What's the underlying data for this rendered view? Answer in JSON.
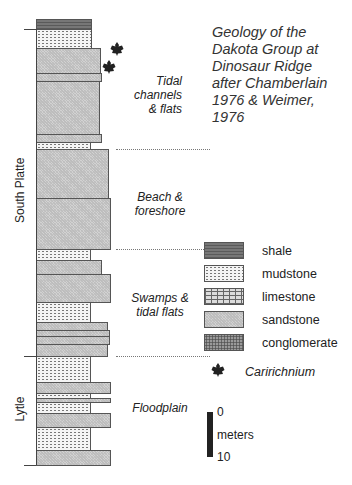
{
  "title": "Geology of the Dakota Group at Dinosaur Ridge after Chamberlain 1976 & Weimer, 1976",
  "title_lines": [
    "Geology of the",
    "Dakota Group at",
    "Dinosaur Ridge",
    "after Chamberlain",
    "1976 & Weimer,",
    "1976"
  ],
  "formations": [
    {
      "name": "South Platte",
      "label": "South Platte"
    },
    {
      "name": "Lytle",
      "label": "Lytle"
    }
  ],
  "environments": [
    {
      "label_lines": [
        "Tidal",
        "channels",
        "& flats"
      ]
    },
    {
      "label_lines": [
        "Beach &",
        "foreshore"
      ]
    },
    {
      "label_lines": [
        "Swamps &",
        "tidal flats"
      ]
    },
    {
      "label_lines": [
        "Floodplain"
      ]
    }
  ],
  "column": {
    "left": 36,
    "layers": [
      {
        "lith": "shale",
        "top": 19,
        "bottom": 29,
        "right": 92
      },
      {
        "lith": "mudstone",
        "top": 29,
        "bottom": 48,
        "right": 92
      },
      {
        "lith": "sandstone",
        "top": 48,
        "bottom": 73,
        "right": 101
      },
      {
        "lith": "sandstone",
        "top": 73,
        "bottom": 81,
        "right": 102
      },
      {
        "lith": "sandstone",
        "top": 81,
        "bottom": 134,
        "right": 100
      },
      {
        "lith": "sandstone",
        "top": 134,
        "bottom": 142,
        "right": 102
      },
      {
        "lith": "mudstone",
        "top": 142,
        "bottom": 149,
        "right": 91
      },
      {
        "lith": "sandstone",
        "top": 149,
        "bottom": 198,
        "right": 109
      },
      {
        "lith": "sandstone",
        "top": 198,
        "bottom": 249,
        "right": 111
      },
      {
        "lith": "mudstone",
        "top": 249,
        "bottom": 260,
        "right": 91
      },
      {
        "lith": "sandstone",
        "top": 260,
        "bottom": 274,
        "right": 102
      },
      {
        "lith": "sandstone",
        "top": 274,
        "bottom": 302,
        "right": 111
      },
      {
        "lith": "mudstone",
        "top": 302,
        "bottom": 322,
        "right": 91
      },
      {
        "lith": "sandstone",
        "top": 322,
        "bottom": 330,
        "right": 108
      },
      {
        "lith": "sandstone",
        "top": 330,
        "bottom": 336,
        "right": 110
      },
      {
        "lith": "sandstone",
        "top": 336,
        "bottom": 344,
        "right": 110
      },
      {
        "lith": "sandstone",
        "top": 344,
        "bottom": 356,
        "right": 108
      },
      {
        "lith": "mudstone",
        "top": 356,
        "bottom": 382,
        "right": 91
      },
      {
        "lith": "sandstone",
        "top": 382,
        "bottom": 393,
        "right": 111
      },
      {
        "lith": "mudstone",
        "top": 393,
        "bottom": 398,
        "right": 91
      },
      {
        "lith": "sandstone",
        "top": 398,
        "bottom": 402,
        "right": 111
      },
      {
        "lith": "mudstone",
        "top": 402,
        "bottom": 413,
        "right": 91
      },
      {
        "lith": "sandstone",
        "top": 413,
        "bottom": 427,
        "right": 111
      },
      {
        "lith": "mudstone",
        "top": 427,
        "bottom": 450,
        "right": 91
      },
      {
        "lith": "sandstone",
        "top": 450,
        "bottom": 465,
        "right": 111
      }
    ]
  },
  "legend": {
    "items": [
      {
        "lith": "shale",
        "label": "shale"
      },
      {
        "lith": "mudstone",
        "label": "mudstone"
      },
      {
        "lith": "limestone",
        "label": "limestone"
      },
      {
        "lith": "sandstone",
        "label": "sandstone"
      },
      {
        "lith": "conglomerate",
        "label": "conglomerate"
      }
    ],
    "fossil": {
      "icon": "dinosaur-track-icon",
      "label": "Caririchnium"
    }
  },
  "scale": {
    "top_label": "0",
    "unit_label": "meters",
    "bottom_label": "10"
  },
  "colors": {
    "ink": "#222222",
    "shale": "#6a6a6a",
    "sandstone": "#d2d2d2",
    "mudstone": "#f4f4f4"
  }
}
